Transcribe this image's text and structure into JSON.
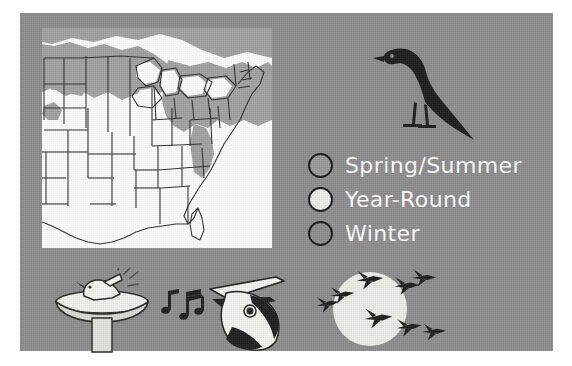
{
  "panel": {
    "background_color": "#8e8e8e",
    "frame_color": "#ffffff"
  },
  "map": {
    "name": "range-map-eastern-united-states",
    "background_color": "#ffffff",
    "outline_color": "#2a2a2a",
    "shade_color": "#a0a0a0",
    "shaded_regions_description": "Northern tier, Great Lakes, New England and southern Canada shaded gray"
  },
  "bird": {
    "name": "perched-bird-silhouette",
    "color": "#1f1f1f"
  },
  "legend": {
    "items": [
      {
        "label": "Spring/Summer",
        "swatch_class": "sw-spring",
        "swatch_color": "#9a9a9a",
        "icon_name": "legend-swatch-spring-summer"
      },
      {
        "label": "Year-Round",
        "swatch_class": "sw-year",
        "swatch_color": "#eeeeea",
        "icon_name": "legend-swatch-year-round"
      },
      {
        "label": "Winter",
        "swatch_class": "sw-winter",
        "swatch_color": "#8e8e8e",
        "icon_name": "legend-swatch-winter"
      }
    ],
    "text_color": "#ffffff"
  },
  "bottom_icons": [
    {
      "name": "birdbath-bathing-icon",
      "description": "Bird splashing in a pedestal bird bath"
    },
    {
      "name": "singing-bird-icon",
      "description": "Bird head with open beak and music notes"
    },
    {
      "name": "migrating-geese-icon",
      "description": "Flock of geese flying across the moon"
    }
  ]
}
